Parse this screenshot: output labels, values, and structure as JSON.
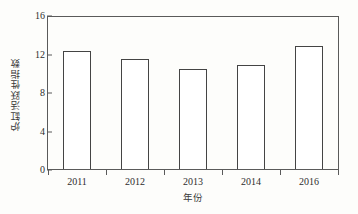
{
  "chart_data": {
    "type": "bar",
    "title": "",
    "subtitle": "",
    "xlabel": "年份",
    "ylabel": "炉缸活跃性指数",
    "categories": [
      "2011",
      "2012",
      "2013",
      "2014",
      "2016"
    ],
    "values": [
      12.4,
      11.6,
      10.5,
      11.0,
      13.0
    ],
    "series": [
      {
        "name": "炉缸活跃性指数",
        "values": [
          12.4,
          11.6,
          10.5,
          11.0,
          13.0
        ]
      }
    ],
    "ylim": [
      0,
      16
    ],
    "yticks": [
      0,
      4,
      8,
      12,
      16
    ],
    "ytick_labels": [
      "0",
      "4",
      "8",
      "12",
      "16"
    ],
    "xtick_labels": [
      "2011",
      "2012",
      "2013",
      "2014",
      "2016"
    ],
    "grid": false,
    "legend": false,
    "legend_position": "none",
    "annotations": [],
    "bar_fill_color": "#ffffff",
    "bar_edge_color": "#444444",
    "axis_color": "#5a5a5a",
    "text_color": "#2e2e2e",
    "background_color": "#fdfdfb"
  }
}
